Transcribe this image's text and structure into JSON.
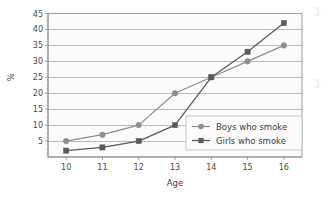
{
  "chart_data": {
    "type": "line",
    "title": "",
    "xlabel": "Age",
    "ylabel": "%",
    "x": [
      10,
      11,
      12,
      13,
      14,
      15,
      16
    ],
    "xtick_labels": [
      "10",
      "11",
      "12",
      "13",
      "14",
      "15",
      "16"
    ],
    "ytick_labels": [
      "5",
      "10",
      "15",
      "20",
      "25",
      "30",
      "35",
      "40",
      "45"
    ],
    "ytick_values": [
      5,
      10,
      15,
      20,
      25,
      30,
      35,
      40,
      45
    ],
    "ylim": [
      0,
      45
    ],
    "xlim": [
      9.5,
      16.5
    ],
    "grid": "horizontal",
    "legend_position": "lower-right-inside",
    "series": [
      {
        "name": "Boys who smoke",
        "marker": "circle",
        "color": "#8e8e8e",
        "values": [
          5,
          7,
          10,
          20,
          25,
          30,
          35
        ]
      },
      {
        "name": "Girls who smoke",
        "marker": "square",
        "color": "#5a5a5a",
        "values": [
          2,
          3,
          5,
          10,
          25,
          33,
          42
        ]
      }
    ]
  },
  "legend": {
    "items": [
      {
        "label": "Boys who smoke"
      },
      {
        "label": "Girls who smoke"
      }
    ]
  },
  "axes": {
    "y_axis_title": "%",
    "x_axis_title": "Age"
  },
  "page_artifacts": {
    "right_edge_top": "1",
    "right_edge_bottom": "1"
  },
  "colors": {
    "plot_background": "#fbfbfb",
    "gridline": "#9c9c9c",
    "axis": "#8a8a8a",
    "boys_series": "#8e8e8e",
    "girls_series": "#5a5a5a",
    "text": "#3c3c3c",
    "legend_border": "#b8b8b8"
  }
}
